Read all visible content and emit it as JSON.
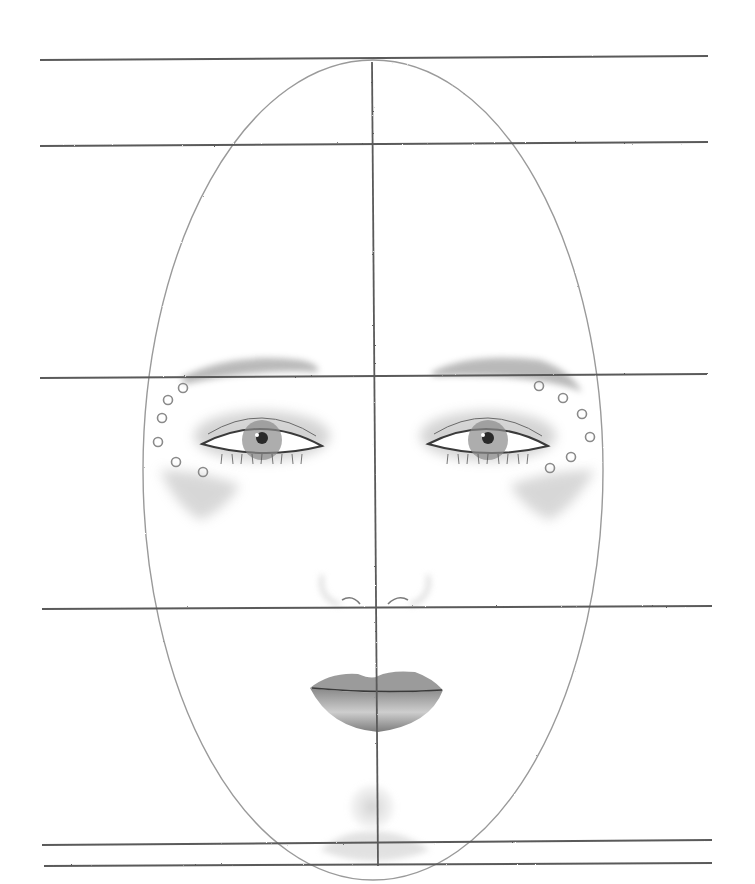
{
  "canvas": {
    "width": 755,
    "height": 884,
    "background": "#ffffff"
  },
  "colors": {
    "guide_line": "#5a5a5a",
    "outline": "#9a9a9a",
    "shading": "#b8b8b8",
    "dark": "#3a3a3a",
    "iris": "#8a8a8a",
    "pupil": "#2a2a2a"
  },
  "guides": {
    "horizontal": [
      {
        "name": "top-of-head-line",
        "x1": 40,
        "y1": 60,
        "x2": 708,
        "y2": 56
      },
      {
        "name": "hairline-line",
        "x1": 40,
        "y1": 146,
        "x2": 708,
        "y2": 142
      },
      {
        "name": "brow-line",
        "x1": 40,
        "y1": 378,
        "x2": 708,
        "y2": 374
      },
      {
        "name": "nose-line",
        "x1": 42,
        "y1": 609,
        "x2": 712,
        "y2": 606
      },
      {
        "name": "chin-upper-line",
        "x1": 42,
        "y1": 845,
        "x2": 712,
        "y2": 840
      },
      {
        "name": "chin-lower-line",
        "x1": 44,
        "y1": 866,
        "x2": 712,
        "y2": 863
      }
    ],
    "vertical": {
      "name": "center-line",
      "x1": 372,
      "y1": 62,
      "x2": 378,
      "y2": 866
    }
  },
  "face": {
    "outline": {
      "cx": 373,
      "cy": 470,
      "rx": 230,
      "ry": 410
    },
    "eyebrows": [
      {
        "side": "left",
        "path": "M180 378 Q230 352 300 360 Q320 364 318 372 Q260 368 186 384 Z"
      },
      {
        "side": "right",
        "path": "M432 372 Q470 352 540 360 Q570 370 582 392 Q540 374 432 376 Z"
      }
    ],
    "eyes": [
      {
        "side": "left",
        "cx": 262,
        "cy": 440,
        "w": 120,
        "h": 42,
        "iris_r": 20,
        "pupil_r": 6
      },
      {
        "side": "right",
        "cx": 488,
        "cy": 440,
        "w": 120,
        "h": 42,
        "iris_r": 20,
        "pupil_r": 6
      }
    ],
    "dots": [
      {
        "cx": 183,
        "cy": 388
      },
      {
        "cx": 168,
        "cy": 400
      },
      {
        "cx": 162,
        "cy": 418
      },
      {
        "cx": 158,
        "cy": 442
      },
      {
        "cx": 176,
        "cy": 462
      },
      {
        "cx": 203,
        "cy": 472
      },
      {
        "cx": 539,
        "cy": 386
      },
      {
        "cx": 563,
        "cy": 398
      },
      {
        "cx": 582,
        "cy": 414
      },
      {
        "cx": 590,
        "cy": 437
      },
      {
        "cx": 571,
        "cy": 457
      },
      {
        "cx": 550,
        "cy": 468
      }
    ],
    "cheeks": [
      {
        "side": "left",
        "path": "M160 470 Q200 470 240 485 Q225 510 200 520 Q175 505 160 470 Z"
      },
      {
        "side": "right",
        "path": "M595 470 Q550 470 510 485 Q525 510 550 520 Q575 505 595 470 Z"
      }
    ],
    "nose": {
      "left": "M342 600 Q352 594 360 604",
      "right": "M388 604 Q398 594 408 600"
    },
    "lips": {
      "upper": "M310 688 Q330 672 358 674 Q372 680 378 676 Q390 670 415 672 Q432 678 443 690 Q376 694 310 688 Z",
      "lower": "M310 688 Q376 696 443 690 Q430 725 378 732 Q330 728 310 688 Z",
      "line": "M312 688 Q376 694 442 690"
    },
    "chin_shadow": {
      "cx": 372,
      "cy": 807,
      "rx": 22,
      "ry": 22
    }
  }
}
